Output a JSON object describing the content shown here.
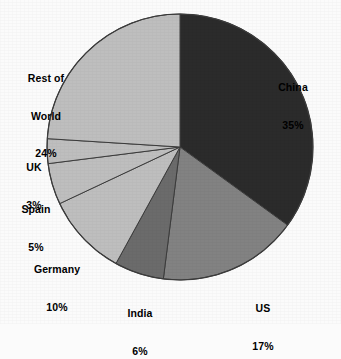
{
  "chart_data": {
    "type": "pie",
    "title": "",
    "subtitle": "",
    "xlabel": "",
    "ylabel": "",
    "legend_position": "none",
    "grid": false,
    "labels_position": "outside",
    "start_angle_deg": 0,
    "direction": "clockwise",
    "categories": [
      "China",
      "US",
      "India",
      "Germany",
      "Spain",
      "UK",
      "Rest of World"
    ],
    "values": [
      35,
      17,
      6,
      10,
      5,
      3,
      24
    ],
    "unit": "%",
    "slices": [
      {
        "label": "China",
        "value": 35,
        "value_text": "35%",
        "color": "#2b2b2b"
      },
      {
        "label": "US",
        "value": 17,
        "value_text": "17%",
        "color": "#828282"
      },
      {
        "label": "India",
        "value": 6,
        "value_text": "6%",
        "color": "#6b6b6b"
      },
      {
        "label": "Germany",
        "value": 10,
        "value_text": "10%",
        "color": "#bebebe"
      },
      {
        "label": "Spain",
        "value": 5,
        "value_text": "5%",
        "color": "#bebebe"
      },
      {
        "label": "UK",
        "value": 3,
        "value_text": "3%",
        "color": "#bebebe"
      },
      {
        "label": "Rest of World",
        "value": 24,
        "value_text": "24%",
        "color": "#bebebe"
      }
    ]
  },
  "labels": {
    "china": {
      "name": "China",
      "value": "35%"
    },
    "us": {
      "name": "US",
      "value": "17%"
    },
    "india": {
      "name": "India",
      "value": "6%"
    },
    "germany": {
      "name": "Germany",
      "value": "10%"
    },
    "spain": {
      "name": "Spain",
      "value": "5%"
    },
    "uk": {
      "name": "UK",
      "value": "3%"
    },
    "rest_of_world": {
      "name_line1": "Rest of",
      "name_line2": "World",
      "value": "24%"
    }
  },
  "colors": {
    "background": "#fbfbfb",
    "text": "#000000",
    "slice_outline": "#3c3c3c",
    "dark_slice": "#2b2b2b",
    "mid_slice": "#828282",
    "mid_dark_slice": "#6b6b6b",
    "light_slice": "#bebebe"
  },
  "geometry": {
    "center_x": 180,
    "center_y": 147,
    "radius": 133
  }
}
